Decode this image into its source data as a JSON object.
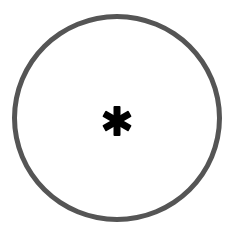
{
  "icon": {
    "name": "asterisk-in-circle",
    "glyph": "asterisk",
    "ring_color": "#555555",
    "glyph_color": "#000000",
    "background": "#ffffff"
  }
}
